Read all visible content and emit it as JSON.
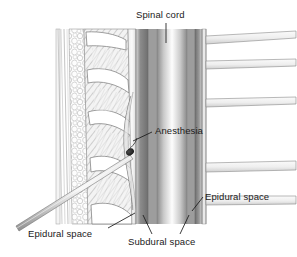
{
  "figure": {
    "type": "medical-illustration",
    "background_color": "#ffffff",
    "width": 297,
    "height": 257,
    "labels": [
      {
        "id": "spinal-cord",
        "text": "Spinal cord",
        "x": 136,
        "y": 10,
        "leader": "vertical-down"
      },
      {
        "id": "anesthesia",
        "text": "Anesthesia",
        "x": 155,
        "y": 126,
        "leader": "down-left"
      },
      {
        "id": "epidural-right",
        "text": "Epidural space",
        "x": 205,
        "y": 192,
        "leader": "down-left"
      },
      {
        "id": "epidural-left",
        "text": "Epidural space",
        "x": 28,
        "y": 229,
        "leader": "up-right"
      },
      {
        "id": "subdural",
        "text": "Subdural space",
        "x": 128,
        "y": 237,
        "leader": "up-both"
      }
    ],
    "structures": [
      {
        "name": "skin-and-fascia-layers",
        "description": "thin vertical line layers at far left"
      },
      {
        "name": "subcutaneous-fat",
        "description": "bubbly cellular vertical strip"
      },
      {
        "name": "vertebral-bodies",
        "description": "four white wedge-shaped bone segments"
      },
      {
        "name": "interspinous-ligament",
        "description": "diagonal hatched tissue between vertebrae"
      },
      {
        "name": "epidural-space",
        "description": "narrow light band just outside the dura"
      },
      {
        "name": "dura-mater",
        "description": "dark grey band enclosing the canal"
      },
      {
        "name": "subdural-space",
        "description": "grey band inside the dura"
      },
      {
        "name": "spinal-cord",
        "description": "bright central vertical column"
      },
      {
        "name": "nerve-roots",
        "description": "five horizontal branches exiting to the right"
      },
      {
        "name": "epidural-needle",
        "description": "long thin diagonal needle from lower left"
      },
      {
        "name": "injection-point",
        "description": "dark teardrop where anesthetic enters"
      }
    ],
    "colors": {
      "ink": "#1a1a1a",
      "line": "#6b6b6b",
      "bone_fill": "#ffffff",
      "dura_dark": "#7d7d7d",
      "cord_bright": "#fdfdfd",
      "tissue_grey": "#b9b9b9"
    }
  }
}
